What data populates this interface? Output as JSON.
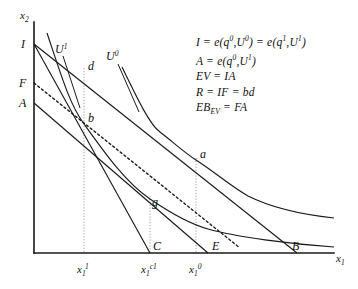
{
  "figure": {
    "kind": "microeconomic-welfare-diagram",
    "axes": {
      "y_label": "x2",
      "y_label_display": "x₂",
      "x_label": "x1",
      "x_label_display": "x₁",
      "origin_px": [
        34,
        253
      ],
      "x_axis_end_px": [
        334,
        253
      ],
      "y_axis_top_px": [
        34,
        22
      ]
    },
    "y_intercept_marks": [
      {
        "name": "I",
        "label": "I",
        "y_px": 44
      },
      {
        "name": "F",
        "label": "F",
        "y_px": 83
      },
      {
        "name": "A",
        "label": "A",
        "y_px": 103
      }
    ],
    "x_axis_ticks": [
      {
        "name": "x1_1",
        "label_base": "x",
        "label_sub": "1",
        "label_sup": "1",
        "x_px": 84,
        "display": "x₁¹"
      },
      {
        "name": "x1_c1",
        "label_base": "x",
        "label_sub": "1",
        "label_sup": "c1",
        "x_px": 150,
        "display": "x₁ᶜ¹"
      },
      {
        "name": "x1_0",
        "label_base": "x",
        "label_sub": "1",
        "label_sup": "0",
        "x_px": 196,
        "display": "x₁⁰"
      }
    ],
    "points": [
      {
        "name": "a",
        "label": "a",
        "x_px": 196,
        "y_px": 160
      },
      {
        "name": "b",
        "label": "b",
        "x_px": 84,
        "y_px": 124
      },
      {
        "name": "d",
        "label": "d",
        "x_px": 84,
        "y_px": 73
      },
      {
        "name": "g",
        "label": "g",
        "x_px": 150,
        "y_px": 199
      },
      {
        "name": "C",
        "label": "C",
        "x_px": 150,
        "y_px": 253
      },
      {
        "name": "E",
        "label": "E",
        "x_px": 208,
        "y_px": 253
      },
      {
        "name": "B",
        "label": "B",
        "x_px": 297,
        "y_px": 253
      }
    ],
    "curve_labels": [
      {
        "name": "U1",
        "label": "U",
        "sup": "1",
        "display": "U¹",
        "x_px": 62,
        "y_px": 49
      },
      {
        "name": "U0",
        "label": "U",
        "sup": "0",
        "display": "U⁰",
        "x_px": 112,
        "y_px": 56
      }
    ],
    "equations": [
      {
        "id": "eq-income",
        "html": "I = e(q<sup>0</sup>,U<sup>0</sup>) = e(q<sup>1</sup>,U<sup>1</sup>)",
        "text": "I = e(q0,U0) = e(q1,U1)"
      },
      {
        "id": "eq-a",
        "html": "A = e(q<sup>0</sup>,U<sup>1</sup>)",
        "text": "A = e(q0,U1)"
      },
      {
        "id": "eq-ev",
        "html": "EV = IA",
        "text": "EV = IA"
      },
      {
        "id": "eq-r",
        "html": "R = IF = bd",
        "text": "R = IF = bd"
      },
      {
        "id": "eq-ebev",
        "html": "EB<sub>EV</sub> = FA",
        "text": "EBEV = FA"
      }
    ],
    "colors": {
      "ink": "#1a1a1a",
      "guide": "#8e8e8e",
      "background": "#ffffff"
    }
  },
  "chart_data": {
    "type": "line",
    "title": "",
    "xlabel": "x1",
    "ylabel": "x2",
    "grid": false,
    "legend": "none",
    "series": [
      {
        "name": "budget-line-I-to-B",
        "kind": "budget-line",
        "points": [
          [
            34,
            44
          ],
          [
            297,
            253
          ]
        ],
        "endpoint_labels": [
          "I",
          "B"
        ]
      },
      {
        "name": "budget-line-I-to-C",
        "kind": "budget-line",
        "points": [
          [
            34,
            44
          ],
          [
            150,
            253
          ]
        ],
        "endpoint_labels": [
          "I",
          "C"
        ]
      },
      {
        "name": "budget-line-A-to-E",
        "kind": "budget-line",
        "points": [
          [
            34,
            103
          ],
          [
            208,
            253
          ]
        ],
        "endpoint_labels": [
          "A",
          "E"
        ]
      },
      {
        "name": "dashed-line-F-through-b-g",
        "kind": "dashed-budget-line",
        "points": [
          [
            34,
            83
          ],
          [
            240,
            248
          ]
        ],
        "endpoint_labels": [
          "F",
          ""
        ]
      },
      {
        "name": "indifference-curve-U1",
        "kind": "indifference-curve",
        "points": [
          [
            47,
            33
          ],
          [
            84,
            124
          ],
          [
            150,
            199
          ],
          [
            208,
            229
          ],
          [
            262,
            241
          ],
          [
            334,
            247
          ]
        ]
      },
      {
        "name": "indifference-curve-U0",
        "kind": "indifference-curve",
        "points": [
          [
            122,
            67
          ],
          [
            160,
            132
          ],
          [
            196,
            160
          ],
          [
            248,
            196
          ],
          [
            290,
            211
          ],
          [
            334,
            218
          ]
        ]
      }
    ],
    "vertical_guides": [
      {
        "x": 84,
        "y_top": 68,
        "y_bottom": 253
      },
      {
        "x": 150,
        "y_top": 196,
        "y_bottom": 253
      },
      {
        "x": 196,
        "y_top": 158,
        "y_bottom": 253
      }
    ],
    "xlim": [
      34,
      334
    ],
    "ylim_px": [
      253,
      22
    ]
  }
}
